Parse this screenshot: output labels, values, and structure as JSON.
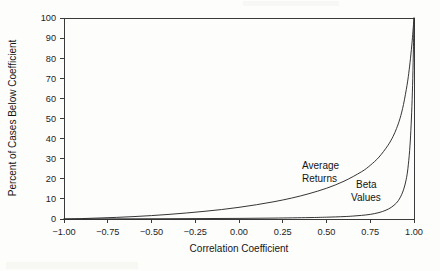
{
  "chart_data": {
    "type": "line",
    "title": "",
    "xlabel": "Correlation Coefficient",
    "ylabel": "Percent of Cases Below Coefficient",
    "xlim": [
      -1.0,
      1.0
    ],
    "ylim": [
      0,
      100
    ],
    "grid": false,
    "legend_position": "inline-annotation",
    "xticks": [
      "-1.00",
      "-0.75",
      "-0.50",
      "-0.25",
      "0.00",
      "0.25",
      "0.50",
      "0.75",
      "1.00"
    ],
    "xtick_values": [
      -1.0,
      -0.75,
      -0.5,
      -0.25,
      0.0,
      0.25,
      0.5,
      0.75,
      1.0
    ],
    "yticks": [
      "0",
      "10",
      "20",
      "30",
      "40",
      "50",
      "60",
      "70",
      "80",
      "90",
      "100"
    ],
    "ytick_values": [
      0,
      10,
      20,
      30,
      40,
      50,
      60,
      70,
      80,
      90,
      100
    ],
    "series": [
      {
        "name": "Average Returns",
        "label": "Average\nReturns",
        "label_line_1": "Average",
        "label_line_2": "Returns",
        "x": [
          -1.0,
          -0.9,
          -0.8,
          -0.7,
          -0.6,
          -0.5,
          -0.4,
          -0.3,
          -0.2,
          -0.1,
          0.0,
          0.1,
          0.2,
          0.3,
          0.4,
          0.5,
          0.6,
          0.7,
          0.75,
          0.8,
          0.85,
          0.88,
          0.9,
          0.92,
          0.94,
          0.96,
          0.97,
          0.98,
          0.99,
          1.0
        ],
        "values": [
          0.0,
          0.2,
          0.5,
          0.8,
          1.2,
          1.7,
          2.3,
          3.0,
          3.8,
          4.7,
          5.8,
          7.1,
          8.6,
          10.4,
          12.6,
          15.3,
          18.8,
          23.5,
          26.7,
          30.8,
          36.5,
          41.0,
          45.0,
          50.0,
          57.0,
          66.5,
          72.5,
          80.0,
          89.0,
          100.0
        ]
      },
      {
        "name": "Beta Values",
        "label": "Beta\nValues",
        "label_line_1": "Beta",
        "label_line_2": "Values",
        "x": [
          -1.0,
          -0.8,
          -0.6,
          -0.4,
          -0.2,
          0.0,
          0.2,
          0.4,
          0.5,
          0.6,
          0.65,
          0.7,
          0.75,
          0.8,
          0.84,
          0.87,
          0.9,
          0.92,
          0.94,
          0.955,
          0.965,
          0.975,
          0.982,
          0.988,
          0.993,
          0.997,
          1.0
        ],
        "values": [
          0.0,
          0.05,
          0.1,
          0.15,
          0.22,
          0.3,
          0.45,
          0.7,
          0.9,
          1.2,
          1.45,
          1.8,
          2.3,
          3.2,
          4.4,
          5.8,
          8.0,
          10.5,
          14.5,
          19.5,
          25.0,
          34.0,
          44.0,
          56.0,
          70.0,
          86.0,
          100.0
        ]
      }
    ]
  },
  "annotations": {
    "average_returns_line1": "Average",
    "average_returns_line2": "Returns",
    "beta_values_line1": "Beta",
    "beta_values_line2": "Values"
  },
  "axes": {
    "x_title": "Correlation Coefficient",
    "y_title": "Percent of Cases Below Coefficient"
  }
}
